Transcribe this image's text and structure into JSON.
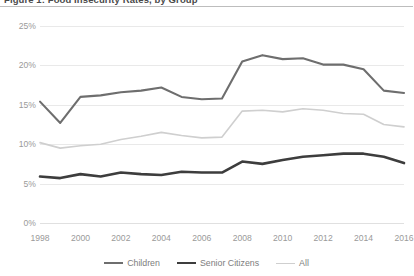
{
  "figure": {
    "title": "Figure 1: Food Insecurity Rates, by Group"
  },
  "colors": {
    "children": "#6e6e6e",
    "senior_citizens": "#3d3d3d",
    "all": "#cfcfcf",
    "gridline": "#e9e9e9",
    "tick_text": "#9a9a9a",
    "legend_text": "#7d7d7d",
    "title_text": "#4a4a4a"
  },
  "axes": {
    "y_ticks": [
      "0%",
      "5%",
      "10%",
      "15%",
      "20%",
      "25%"
    ],
    "x_ticks": [
      "1998",
      "2000",
      "2002",
      "2004",
      "2006",
      "2008",
      "2010",
      "2012",
      "2014",
      "2016"
    ]
  },
  "legend": {
    "items": [
      {
        "label": "Children",
        "color": "#6e6e6e",
        "width": 2.1
      },
      {
        "label": "Senior Citizens",
        "color": "#3d3d3d",
        "width": 2.6
      },
      {
        "label": "All",
        "color": "#cfcfcf",
        "width": 1.6
      }
    ]
  },
  "chart_data": {
    "type": "line",
    "title": "Figure 1: Food Insecurity Rates, by Group",
    "xlabel": "",
    "ylabel": "",
    "ylim": [
      0,
      25
    ],
    "xlim": [
      1998,
      2016
    ],
    "grid": true,
    "legend_position": "bottom",
    "x": [
      1998,
      1999,
      2000,
      2001,
      2002,
      2003,
      2004,
      2005,
      2006,
      2007,
      2008,
      2009,
      2010,
      2011,
      2012,
      2013,
      2014,
      2015,
      2016
    ],
    "series": [
      {
        "name": "Children",
        "color": "#6e6e6e",
        "values": [
          15.4,
          12.7,
          16.0,
          16.2,
          16.6,
          16.8,
          17.2,
          16.0,
          15.7,
          15.8,
          20.5,
          21.3,
          20.8,
          20.9,
          20.1,
          20.1,
          19.5,
          16.8,
          16.5
        ]
      },
      {
        "name": "Senior Citizens",
        "color": "#3d3d3d",
        "values": [
          5.9,
          5.7,
          6.2,
          5.9,
          6.4,
          6.2,
          6.1,
          6.5,
          6.4,
          6.4,
          7.8,
          7.5,
          8.0,
          8.4,
          8.6,
          8.8,
          8.8,
          8.4,
          7.6
        ]
      },
      {
        "name": "All",
        "color": "#cfcfcf",
        "values": [
          10.2,
          9.5,
          9.8,
          10.0,
          10.6,
          11.0,
          11.5,
          11.1,
          10.8,
          10.9,
          14.2,
          14.3,
          14.1,
          14.5,
          14.3,
          13.9,
          13.8,
          12.5,
          12.2
        ]
      }
    ]
  }
}
